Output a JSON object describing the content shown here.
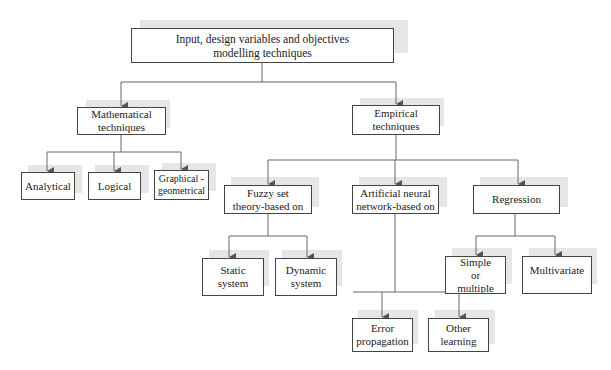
{
  "diagram": {
    "type": "hierarchy",
    "root": {
      "id": "root",
      "label": "Input, design variables and objectives modelling techniques"
    },
    "level1": [
      {
        "id": "mathematical",
        "label": "Mathematical techniques"
      },
      {
        "id": "empirical",
        "label": "Empirical techniques"
      }
    ],
    "mathematical_children": [
      {
        "id": "analytical",
        "label": "Analytical"
      },
      {
        "id": "logical",
        "label": "Logical"
      },
      {
        "id": "graphical",
        "label": "Graphical - geometrical"
      }
    ],
    "empirical_children": [
      {
        "id": "fuzzy",
        "label": "Fuzzy set theory-based on"
      },
      {
        "id": "ann",
        "label": "Artificial neural network-based on"
      },
      {
        "id": "regression",
        "label": "Regression"
      }
    ],
    "fuzzy_children": [
      {
        "id": "static",
        "label": "Static system"
      },
      {
        "id": "dynamic",
        "label": "Dynamic system"
      }
    ],
    "ann_children": [
      {
        "id": "error",
        "label": "Error propagation learning"
      },
      {
        "id": "other",
        "label": "Other learning techniques"
      }
    ],
    "regression_children": [
      {
        "id": "simple",
        "label": "Simple or multiple"
      },
      {
        "id": "multivariate",
        "label": "Multivariate"
      }
    ]
  }
}
